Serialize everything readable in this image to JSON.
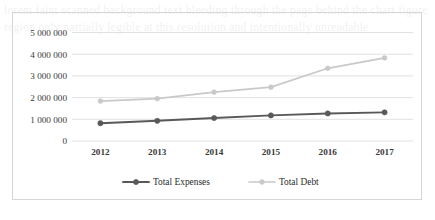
{
  "figure": {
    "border_color": "#d6d6d6",
    "background": "#ffffff"
  },
  "page_bleed_text": "lorem faint scanned background text bleeding through the page behind the chart figure region only partially legible at this resolution and intentionally unreadable",
  "chart_data": {
    "type": "line",
    "title": "",
    "subtitle": "",
    "xlabel": "",
    "ylabel": "",
    "categories": [
      "2012",
      "2013",
      "2014",
      "2015",
      "2016",
      "2017"
    ],
    "series": [
      {
        "name": "Total Expenses",
        "color": "#595959",
        "marker": "circle",
        "values": [
          820000,
          930000,
          1060000,
          1180000,
          1270000,
          1320000
        ]
      },
      {
        "name": "Total Debt",
        "color": "#c9c9c9",
        "marker": "circle",
        "values": [
          1840000,
          1950000,
          2250000,
          2480000,
          3350000,
          3830000
        ]
      }
    ],
    "ylim": [
      0,
      5000000
    ],
    "yticks": [
      0,
      1000000,
      2000000,
      3000000,
      4000000,
      5000000
    ],
    "ytick_labels": [
      "0",
      "1 000 000",
      "2 000 000",
      "3 000 000",
      "4 000 000",
      "5 000 000"
    ],
    "grid": true,
    "grid_color": "#d9d9d9",
    "legend_position": "bottom",
    "legend": [
      {
        "label": "Total Expenses",
        "color": "#595959"
      },
      {
        "label": "Total Debt",
        "color": "#c9c9c9"
      }
    ]
  }
}
